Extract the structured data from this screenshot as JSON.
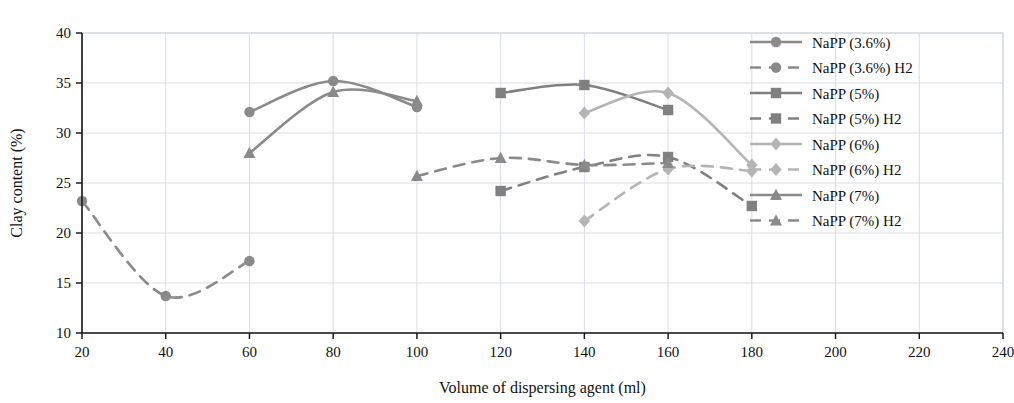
{
  "chart_data": {
    "type": "line",
    "title": "",
    "xlabel": "Volume of dispersing agent (ml)",
    "ylabel": "Clay content (%)",
    "xlim": [
      20,
      240
    ],
    "ylim": [
      10,
      40
    ],
    "xticks": [
      20,
      40,
      60,
      80,
      100,
      120,
      140,
      160,
      180,
      200,
      220,
      240
    ],
    "yticks": [
      10,
      15,
      20,
      25,
      30,
      35,
      40
    ],
    "grid": true,
    "legend_position": "top-right",
    "series": [
      {
        "name": "NaPP (3.6%)",
        "marker": "circle",
        "line": "solid",
        "color": "#8a8a8a",
        "x": [
          60,
          80,
          100
        ],
        "values": [
          32.1,
          35.2,
          32.6
        ]
      },
      {
        "name": "NaPP (3.6%) H2",
        "marker": "circle",
        "line": "dashed",
        "color": "#8a8a8a",
        "x": [
          20,
          40,
          60
        ],
        "values": [
          23.2,
          13.7,
          17.2
        ]
      },
      {
        "name": "NaPP (5%)",
        "marker": "square",
        "line": "solid",
        "color": "#808080",
        "x": [
          120,
          140,
          160
        ],
        "values": [
          34.0,
          34.8,
          32.3
        ]
      },
      {
        "name": "NaPP (5%) H2",
        "marker": "square",
        "line": "dashed",
        "color": "#808080",
        "x": [
          120,
          140,
          160,
          180
        ],
        "values": [
          24.2,
          26.6,
          27.6,
          22.7
        ]
      },
      {
        "name": "NaPP (6%)",
        "marker": "diamond",
        "line": "solid",
        "color": "#b4b4b4",
        "x": [
          140,
          160,
          180
        ],
        "values": [
          32.0,
          34.0,
          26.8
        ]
      },
      {
        "name": "NaPP (6%) H2",
        "marker": "diamond",
        "line": "dashed",
        "color": "#b4b4b4",
        "x": [
          140,
          160,
          180
        ],
        "values": [
          21.2,
          26.4,
          26.2
        ]
      },
      {
        "name": "NaPP (7%)",
        "marker": "triangle",
        "line": "solid",
        "color": "#8a8a8a",
        "x": [
          60,
          80,
          100
        ],
        "values": [
          28.0,
          34.1,
          33.2
        ]
      },
      {
        "name": "NaPP (7%) H2",
        "marker": "triangle",
        "line": "dashed",
        "color": "#8a8a8a",
        "x": [
          100,
          120,
          140,
          160
        ],
        "values": [
          25.7,
          27.5,
          26.8,
          27.0
        ]
      }
    ]
  },
  "axes": {
    "x_title": "Volume of dispersing agent (ml)",
    "y_title": "Clay content (%)",
    "x_tick_labels": [
      "20",
      "40",
      "60",
      "80",
      "100",
      "120",
      "140",
      "160",
      "180",
      "200",
      "220",
      "240"
    ],
    "y_tick_labels": [
      "10",
      "15",
      "20",
      "25",
      "30",
      "35",
      "40"
    ]
  },
  "legend": {
    "entries": [
      {
        "label": "NaPP (3.6%)"
      },
      {
        "label": "NaPP (3.6%) H2"
      },
      {
        "label": "NaPP (5%)"
      },
      {
        "label": "NaPP (5%) H2"
      },
      {
        "label": "NaPP (6%)"
      },
      {
        "label": "NaPP (6%) H2"
      },
      {
        "label": "NaPP (7%)"
      },
      {
        "label": "NaPP (7%) H2"
      }
    ]
  },
  "colors": {
    "dark_gray": "#8a8a8a",
    "mid_gray": "#808080",
    "light_gray": "#b4b4b4",
    "grid": "#d9dde6",
    "axis": "#1a1a1a"
  }
}
